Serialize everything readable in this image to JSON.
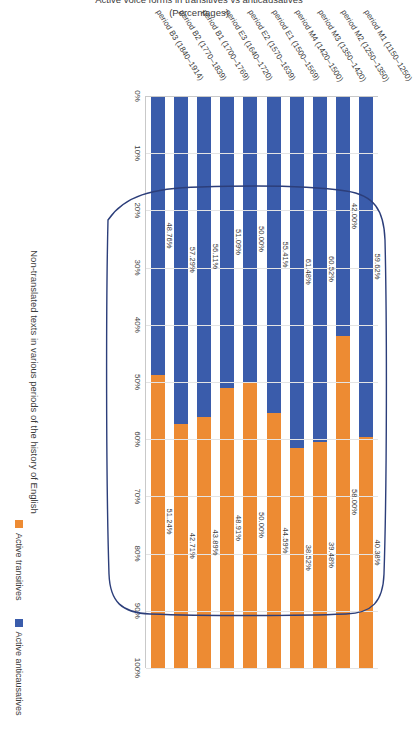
{
  "chart_data": {
    "type": "bar",
    "variant": "stacked-100-horizontal-rotated",
    "title": "",
    "xlabel": "Non-translated texts in various periods of the history of English",
    "ylabel": "Active voice forms in transitives vs anticausatives (Percentages)",
    "ylim": [
      0,
      100
    ],
    "grid": true,
    "legend_position": "bottom-right",
    "categories": [
      "period M1 (1150–1250)",
      "period M2 (1250–1350)",
      "period M3 (1350–1420)",
      "period M4 (1420–1500)",
      "period E1 (1500–1569)",
      "period E2 (1570–1639)",
      "period E3 (1640–1720)",
      "period B1 (1700–1769)",
      "period B2 (1770–1839)",
      "period B3 (1840–1914)"
    ],
    "ticks": [
      "0%",
      "10%",
      "20%",
      "30%",
      "40%",
      "50%",
      "60%",
      "70%",
      "80%",
      "90%",
      "100%"
    ],
    "series": [
      {
        "name": "Active anticausatives",
        "color": "#3a5cab",
        "values": [
          59.62,
          42.0,
          60.52,
          61.48,
          55.41,
          50.0,
          51.09,
          56.11,
          57.29,
          48.76
        ],
        "labels": [
          "59.62%",
          "42.00%",
          "60.52%",
          "61.48%",
          "55.41%",
          "50.00%",
          "51.09%",
          "56.11%",
          "57.29%",
          "48.76%"
        ]
      },
      {
        "name": "Active transitives",
        "color": "#ed8b33",
        "values": [
          40.38,
          58.0,
          39.48,
          38.52,
          44.59,
          50.0,
          48.91,
          43.89,
          42.71,
          51.24
        ],
        "labels": [
          "40.38%",
          "58.00%",
          "39.48%",
          "38.52%",
          "44.59%",
          "50.00%",
          "48.91%",
          "43.89%",
          "42.71%",
          "51.24%"
        ]
      }
    ],
    "annotation": {
      "type": "hand-drawn-rounded-rectangle",
      "color": "#2c3e7a",
      "encircles": [
        "period M4 (1420–1500)",
        "period E1 (1500–1569)",
        "period E2 (1570–1639)",
        "period E3 (1640–1720)",
        "period B1 (1700–1769)",
        "period B2 (1770–1839)",
        "period B3 (1840–1914)"
      ]
    }
  },
  "legend": {
    "items": [
      {
        "label": "Active transitives",
        "color": "#ed8b33"
      },
      {
        "label": "Active anticausatives",
        "color": "#3a5cab"
      }
    ]
  },
  "axes": {
    "x_title": "Non-translated texts in various periods of the history of English",
    "y_title": "Active voice forms in transitives vs anticausatives (Percentages)"
  }
}
